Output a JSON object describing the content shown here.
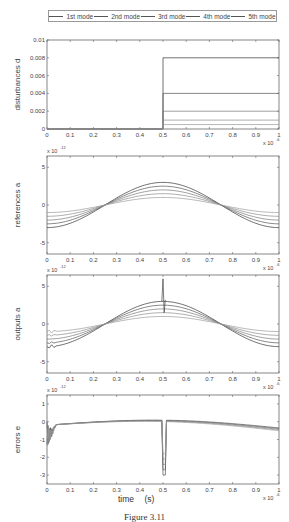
{
  "legend": {
    "items": [
      "1st mode",
      "2nd mode",
      "3rd mode",
      "4th mode",
      "5th mode"
    ]
  },
  "xlabel": "time    (s)",
  "caption": "Figure 3.11",
  "chart_data": [
    {
      "type": "line",
      "title": "",
      "ylabel": "disturbances  d_k",
      "xlabel": "",
      "x_multiplier": "x 10^-6",
      "xlim": [
        0,
        1
      ],
      "ylim": [
        0,
        0.01
      ],
      "xticks": [
        "0",
        "0.1",
        "0.2",
        "0.3",
        "0.4",
        "0.5",
        "0.6",
        "0.7",
        "0.8",
        "0.9",
        "1"
      ],
      "yticks": [
        "0",
        "0.002",
        "0.004",
        "0.006",
        "0.008",
        "0.01"
      ],
      "description": "Step disturbances applied at t=0.5e-6 s",
      "x": [
        0,
        0.5,
        0.5,
        1
      ],
      "series": [
        {
          "name": "1st mode",
          "values": [
            0,
            0,
            0.008,
            0.008
          ]
        },
        {
          "name": "2nd mode",
          "values": [
            0,
            0,
            0.004,
            0.004
          ]
        },
        {
          "name": "3rd mode",
          "values": [
            0,
            0,
            0.002,
            0.002
          ]
        },
        {
          "name": "4th mode",
          "values": [
            0,
            0,
            0.001,
            0.001
          ]
        },
        {
          "name": "5th mode",
          "values": [
            0,
            0,
            0.0005,
            0.0005
          ]
        }
      ]
    },
    {
      "type": "line",
      "ylabel": "references  ā_k",
      "y_multiplier": "x 10^-12",
      "x_multiplier": "x 10^-6",
      "xlim": [
        0,
        1
      ],
      "ylim": [
        -6.5,
        6.5
      ],
      "xticks": [
        "0",
        "0.1",
        "0.2",
        "0.3",
        "0.4",
        "0.5",
        "0.6",
        "0.7",
        "0.8",
        "0.9",
        "1"
      ],
      "yticks": [
        "-5",
        "0",
        "5"
      ],
      "x": [
        0,
        0.25,
        0.5,
        0.75,
        1
      ],
      "series": [
        {
          "name": "1st mode",
          "values": [
            -3,
            0,
            3,
            0,
            -3
          ]
        },
        {
          "name": "2nd mode",
          "values": [
            -2.5,
            0,
            2.5,
            0,
            -2.5
          ]
        },
        {
          "name": "3rd mode",
          "values": [
            -2,
            0,
            2,
            0,
            -2
          ]
        },
        {
          "name": "4th mode",
          "values": [
            -1.5,
            0,
            1.5,
            0,
            -1.5
          ]
        },
        {
          "name": "5th mode",
          "values": [
            -1,
            0,
            1,
            0,
            -1
          ]
        }
      ]
    },
    {
      "type": "line",
      "ylabel": "outputs  a_k",
      "y_multiplier": "x 10^-12",
      "x_multiplier": "x 10^-6",
      "xlim": [
        0,
        1
      ],
      "ylim": [
        -6.5,
        6.5
      ],
      "xticks": [
        "0",
        "0.1",
        "0.2",
        "0.3",
        "0.4",
        "0.5",
        "0.6",
        "0.7",
        "0.8",
        "0.9",
        "1"
      ],
      "yticks": [
        "-5",
        "0",
        "5"
      ],
      "description": "Outputs track references with transient at t=0 and spike at t=0.5 (peak ~6)",
      "x": [
        0,
        0.25,
        0.5,
        0.75,
        1
      ],
      "series": [
        {
          "name": "1st mode",
          "values": [
            -3,
            0,
            3,
            0,
            -3
          ]
        },
        {
          "name": "2nd mode",
          "values": [
            -2.5,
            0,
            2.5,
            0,
            -2.5
          ]
        },
        {
          "name": "3rd mode",
          "values": [
            -2,
            0,
            2,
            0,
            -2
          ]
        },
        {
          "name": "4th mode",
          "values": [
            -1.5,
            0,
            1.5,
            0,
            -1.5
          ]
        },
        {
          "name": "5th mode",
          "values": [
            -1,
            0,
            1,
            0,
            -1
          ]
        }
      ],
      "spike": {
        "x": 0.5,
        "peak": 6
      }
    },
    {
      "type": "line",
      "ylabel": "errors  e_k",
      "y_multiplier": "x 10^-12",
      "x_multiplier": "x 10^-6",
      "xlim": [
        0,
        1
      ],
      "ylim": [
        -3.5,
        1.5
      ],
      "xticks": [
        "0",
        "0.1",
        "0.2",
        "0.3",
        "0.4",
        "0.5",
        "0.6",
        "0.7",
        "0.8",
        "0.9",
        "1"
      ],
      "yticks": [
        "-3",
        "-2",
        "-1",
        "0",
        "1"
      ],
      "description": "Errors near zero, transient at t=0 (down to ~-1.5) and spike at t=0.5 (down to ~-3)",
      "x": [
        0,
        0.03,
        0.25,
        0.5,
        0.51,
        0.55,
        0.75,
        1
      ],
      "series": [
        {
          "name": "error envelope",
          "values": [
            0,
            -0.2,
            0,
            0.2,
            -3,
            0.2,
            0,
            -0.3
          ]
        }
      ]
    }
  ]
}
